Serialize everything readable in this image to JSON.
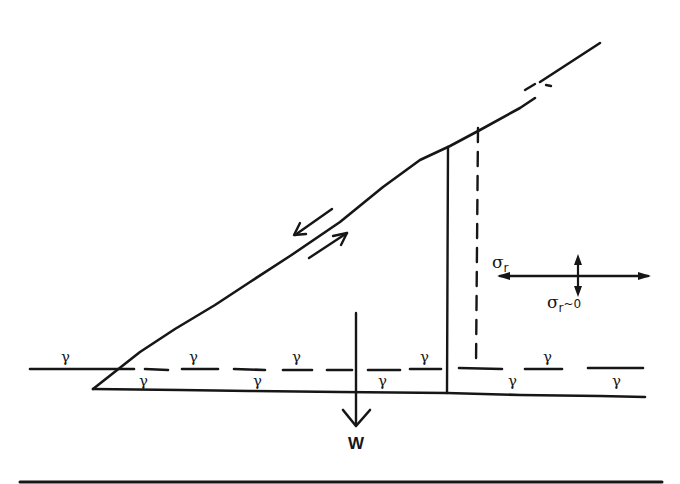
{
  "diagram": {
    "colors": {
      "ink": "#161616",
      "background": "#ffffff"
    },
    "labels": {
      "weight": "W",
      "sigma_r": "σ",
      "sigma_r_sub": "r",
      "sigma_r_approx": "σ",
      "sigma_r_approx_sub": "r",
      "sigma_r_approx_tail": "~0"
    },
    "gamma_symbol": "γ",
    "gamma_labels": [
      {
        "x": 61,
        "y": 362,
        "text": "γ"
      },
      {
        "x": 141,
        "y": 384,
        "text": "γ"
      },
      {
        "x": 193,
        "y": 362,
        "text": "γ"
      },
      {
        "x": 257,
        "y": 384,
        "text": "γ"
      },
      {
        "x": 296,
        "y": 362,
        "text": "γ"
      },
      {
        "x": 383,
        "y": 384,
        "text": "γ"
      },
      {
        "x": 425,
        "y": 362,
        "text": "γ"
      },
      {
        "x": 513,
        "y": 384,
        "text": "γ"
      },
      {
        "x": 548,
        "y": 362,
        "text": "γ"
      },
      {
        "x": 617,
        "y": 384,
        "text": "γ"
      }
    ]
  }
}
